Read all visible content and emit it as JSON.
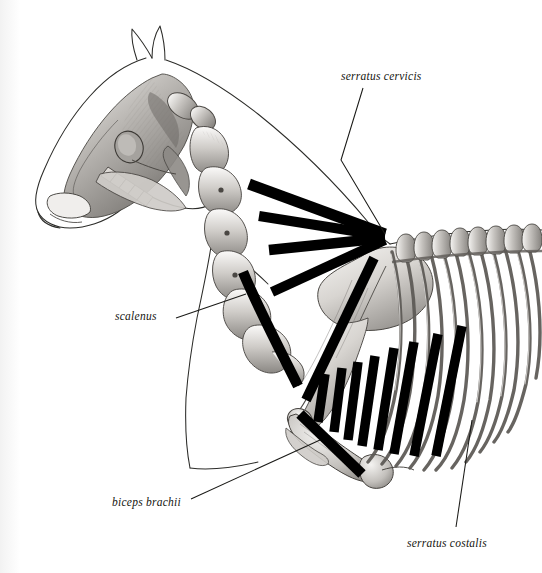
{
  "plate": {
    "title": "Equine forelimb and neck musculature — serratus group",
    "subject": "horse skeleton, left lateral view",
    "background_color": "#ffffff",
    "muscle_band_color": "#000000",
    "outline_color": "#2b2b28",
    "leader_line_color": "#1a1a17",
    "bone_shade_light": "#e9e7e4",
    "bone_shade_mid": "#b4b1ad",
    "bone_shade_dark": "#6f6c68"
  },
  "labels": [
    {
      "id": "serratus-cervicis",
      "text": "serratus cervicis",
      "style": "italic",
      "x": 341,
      "y": 71,
      "leader": "from label down-left to the converging fan apex at the dorsal scapula"
    },
    {
      "id": "scalenus",
      "text": "scalenus",
      "style": "italic",
      "x": 115,
      "y": 311,
      "leader": "from label up-right to the thick band along the lower cervical vertebrae"
    },
    {
      "id": "biceps-brachii",
      "text": "biceps brachii",
      "style": "italic",
      "x": 112,
      "y": 497,
      "leader": "from label up-right to the band at the shoulder joint and humerus"
    },
    {
      "id": "serratus-costalis",
      "text": "serratus costalis",
      "style": "italic",
      "x": 407,
      "y": 538,
      "leader": "from label up to the oblique bands lying across the ribs"
    }
  ],
  "anatomy": {
    "head": {
      "name": "skull and mandible",
      "outline": "horse head profile outline, muzzle at lower left, ears at top",
      "features": [
        "orbit",
        "nasal bone",
        "zygomatic arch",
        "mandible",
        "cheek teeth row",
        "incisors",
        "ears"
      ]
    },
    "neck": {
      "name": "cervical vertebrae",
      "count": 7,
      "description": "chain of cervical vertebrae curving from the atlas behind the skull down and back to the thoracic inlet"
    },
    "thorax": {
      "name": "ribcage and thoracic vertebrae",
      "rib_count": 14,
      "description": "curved ribs radiating ventrally from the thoracic spinous processes"
    },
    "forelimb": {
      "bones": [
        "scapula",
        "humerus",
        "radius",
        "ulna"
      ],
      "description": "scapula lying obliquely over the cranial ribs, humerus angled caudo-ventrally to the elbow"
    }
  },
  "muscle_bands": {
    "serratus_cervicis": {
      "label": "serratus cervicis",
      "count": 4,
      "color": "#000000",
      "description": "four thick black straps fanning from the transverse processes of the cervical vertebrae caudally to a common apex at the dorsal scapular border"
    },
    "scalenus": {
      "label": "scalenus",
      "count": 1,
      "color": "#000000",
      "description": "single broad band running along the ventral cervical vertebrae toward the first rib"
    },
    "biceps_brachii": {
      "label": "biceps brachii",
      "count": 1,
      "color": "#000000",
      "description": "band from the point of the shoulder running disto-caudally across the humerus"
    },
    "serratus_costalis": {
      "label": "serratus costalis",
      "count": 8,
      "color": "#000000",
      "description": "series of parallel oblique black straps lying across the ribs, inclined cranio-ventrally, increasing in length caudally"
    }
  }
}
